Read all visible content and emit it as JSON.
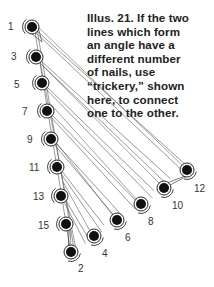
{
  "caption": {
    "lines": [
      "Illus. 21. If the two",
      "lines which form",
      "an angle have a",
      "different number",
      "of nails, use",
      "“trickery,” shown",
      "here, to connect",
      "one to the other."
    ]
  },
  "colors": {
    "thread": "#444444",
    "nail": "#111111",
    "text": "#222222",
    "background": "#ffffff"
  },
  "nails": {
    "left_line": [
      {
        "label": "1",
        "x": 32,
        "y": 27,
        "lx": 8,
        "ly": 30
      },
      {
        "label": "3",
        "x": 36,
        "y": 57,
        "lx": 11,
        "ly": 60
      },
      {
        "label": "5",
        "x": 42,
        "y": 83,
        "lx": 14,
        "ly": 88
      },
      {
        "label": "7",
        "x": 47,
        "y": 111,
        "lx": 22,
        "ly": 115
      },
      {
        "label": "9",
        "x": 51,
        "y": 139,
        "lx": 27,
        "ly": 143
      },
      {
        "label": "11",
        "x": 57,
        "y": 167,
        "lx": 29,
        "ly": 171
      },
      {
        "label": "13",
        "x": 61,
        "y": 196,
        "lx": 33,
        "ly": 200
      },
      {
        "label": "15",
        "x": 66,
        "y": 224,
        "lx": 38,
        "ly": 229
      }
    ],
    "bottom_line": [
      {
        "label": "2",
        "x": 71,
        "y": 252,
        "lx": 78,
        "ly": 272
      },
      {
        "label": "4",
        "x": 94,
        "y": 236,
        "lx": 102,
        "ly": 257
      },
      {
        "label": "6",
        "x": 117,
        "y": 220,
        "lx": 125,
        "ly": 241
      },
      {
        "label": "8",
        "x": 141,
        "y": 204,
        "lx": 148,
        "ly": 225
      },
      {
        "label": "10",
        "x": 164,
        "y": 188,
        "lx": 172,
        "ly": 209
      },
      {
        "label": "12",
        "x": 187,
        "y": 170,
        "lx": 194,
        "ly": 192
      }
    ]
  }
}
